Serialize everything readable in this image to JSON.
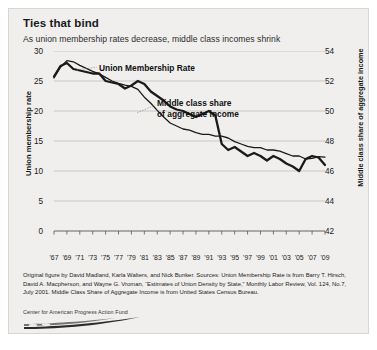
{
  "figure": {
    "title": "Ties that bind",
    "subtitle": "As union membership rates decrease, middle class incomes shrink",
    "footnote": "Original figure by David Madland, Karla Walters, and Nick Bunker. Sources: Union Membership Rate is from Barry T. Hirsch, David A. Macpherson, and Wayne G. Vroman, “Estimates of Union Density by State,” Monthly Labor Review, Vol. 124, No.7, July 2001. Middle Class Share of Aggregate Income is from United States Census Bureau.",
    "logo_text": "Center for American Progress Action Fund",
    "background_color": "#f0efed",
    "line_color": "#1a1a1a"
  },
  "chart_data": {
    "type": "line",
    "title": "Ties that bind",
    "subtitle": "As union membership rates decrease, middle class incomes shrink",
    "xlabel": "",
    "ylabel": "Union membership rate",
    "ylabel_right": "Middle class share of aggregate income",
    "grid": true,
    "legend_position": "inline-annotations",
    "xlim": [
      1967,
      2009
    ],
    "ylim": [
      0,
      30
    ],
    "ylim_right": [
      42,
      54
    ],
    "yticks": [
      0,
      5,
      10,
      15,
      20,
      25,
      30
    ],
    "yticks_right": [
      42,
      44,
      46,
      48,
      50,
      52,
      54
    ],
    "xticks": [
      "'67",
      "'69",
      "'71",
      "'73",
      "'75",
      "'77",
      "'79",
      "'81",
      "'83",
      "'85",
      "'87",
      "'89",
      "'91",
      "'93",
      "'95",
      "'97",
      "'99",
      "'01",
      "'03",
      "'05",
      "'07",
      "'09"
    ],
    "x": [
      1967,
      1968,
      1969,
      1970,
      1971,
      1972,
      1973,
      1974,
      1975,
      1976,
      1977,
      1978,
      1979,
      1980,
      1981,
      1982,
      1983,
      1984,
      1985,
      1986,
      1987,
      1988,
      1989,
      1990,
      1991,
      1992,
      1993,
      1994,
      1995,
      1996,
      1997,
      1998,
      1999,
      2000,
      2001,
      2002,
      2003,
      2004,
      2005,
      2006,
      2007,
      2008,
      2009
    ],
    "series": [
      {
        "name": "Union Membership Rate",
        "axis": "left",
        "units": "percent",
        "line_width": "thin",
        "values": [
          25.5,
          27.3,
          28.4,
          28.2,
          27.6,
          27.1,
          26.6,
          26.2,
          25.6,
          25.0,
          24.6,
          24.3,
          24.1,
          23.6,
          22.3,
          21.3,
          20.1,
          19.0,
          18.0,
          17.5,
          17.0,
          16.8,
          16.4,
          16.1,
          16.1,
          15.8,
          15.8,
          15.5,
          14.9,
          14.5,
          14.1,
          13.9,
          13.9,
          13.5,
          13.5,
          13.3,
          12.9,
          12.5,
          12.5,
          12.0,
          12.1,
          12.4,
          12.3
        ]
      },
      {
        "name": "Middle class share of aggregate income",
        "axis": "right",
        "units": "percent",
        "line_width": "thick",
        "values": [
          52.3,
          53.0,
          53.2,
          52.8,
          52.7,
          52.6,
          52.5,
          52.5,
          52.0,
          51.9,
          51.8,
          51.5,
          51.7,
          52.0,
          51.8,
          51.3,
          51.0,
          50.7,
          50.3,
          50.1,
          50.0,
          49.8,
          49.6,
          49.8,
          50.0,
          49.7,
          47.8,
          47.4,
          47.6,
          47.3,
          47.0,
          47.2,
          47.0,
          46.7,
          47.0,
          46.8,
          46.5,
          46.3,
          46.0,
          46.8,
          47.0,
          46.9,
          46.4
        ]
      }
    ],
    "annotations": [
      {
        "text": "Union Membership Rate",
        "target_series": "Union Membership Rate"
      },
      {
        "text": "Middle class share\nof aggregate income",
        "target_series": "Middle class share of aggregate income"
      }
    ]
  },
  "labels": {
    "union_line1": "Union Membership Rate",
    "middle_line1": "Middle class share",
    "middle_line2": "of aggregate income"
  }
}
